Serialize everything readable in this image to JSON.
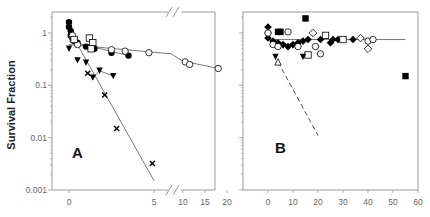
{
  "figure": {
    "ylabel": "Survival Fraction",
    "panels": [
      "A",
      "B"
    ]
  },
  "chart_data": [
    {
      "type": "scatter",
      "panel_label": "A",
      "title": "",
      "xlabel": "",
      "ylabel": "Survival Fraction",
      "yscale": "log",
      "ylim": [
        0.001,
        2
      ],
      "yticks": [
        "0.001",
        "0.01",
        "0.1",
        "1"
      ],
      "xticks": [
        "0",
        "5",
        "10",
        "15",
        "20"
      ],
      "x_axis_break": [
        6,
        9
      ],
      "grid": false,
      "series": [
        {
          "name": "filled circles",
          "marker": "filled-circle",
          "points": [
            [
              0,
              1.6
            ],
            [
              0,
              1.3
            ],
            [
              0.1,
              1.1
            ],
            [
              0.1,
              0.9
            ],
            [
              0.2,
              0.8
            ],
            [
              0.3,
              0.7
            ],
            [
              0.5,
              0.65
            ],
            [
              1,
              0.55
            ],
            [
              1.5,
              0.5
            ],
            [
              2.5,
              0.42
            ],
            [
              3.5,
              0.37
            ]
          ],
          "fit": [
            [
              0,
              0.7
            ],
            [
              3.5,
              0.37
            ]
          ]
        },
        {
          "name": "open circles",
          "marker": "open-circle",
          "points": [
            [
              0.2,
              0.9
            ],
            [
              0.5,
              0.6
            ],
            [
              1.3,
              0.55
            ],
            [
              2.5,
              0.48
            ],
            [
              3.3,
              0.45
            ],
            [
              4.7,
              0.42
            ],
            [
              10.5,
              0.28
            ],
            [
              11.5,
              0.25
            ],
            [
              18,
              0.21
            ]
          ],
          "fit": [
            [
              0,
              0.6
            ],
            [
              6,
              0.4
            ],
            [
              10,
              0.29
            ],
            [
              18,
              0.21
            ]
          ]
        },
        {
          "name": "open squares",
          "marker": "open-square",
          "points": [
            [
              0.3,
              0.75
            ],
            [
              1.2,
              0.8
            ],
            [
              1.4,
              0.65
            ],
            [
              1.3,
              0.5
            ]
          ]
        },
        {
          "name": "filled triangles down",
          "marker": "filled-triangle-down",
          "points": [
            [
              0,
              0.5
            ],
            [
              0.5,
              0.3
            ],
            [
              1,
              0.27
            ],
            [
              1.4,
              0.14
            ],
            [
              1.8,
              0.19
            ],
            [
              2.6,
              0.15
            ]
          ],
          "fit": [
            [
              1.4,
              0.14
            ],
            [
              1.8,
              0.19
            ],
            [
              2.6,
              0.15
            ]
          ]
        },
        {
          "name": "crosses",
          "marker": "x",
          "points": [
            [
              1.1,
              0.17
            ],
            [
              2.1,
              0.065
            ],
            [
              2.8,
              0.015
            ],
            [
              4.9,
              0.0032
            ]
          ],
          "fit": [
            [
              0.5,
              0.6
            ],
            [
              5,
              0.0015
            ]
          ]
        }
      ]
    },
    {
      "type": "scatter",
      "panel_label": "B",
      "title": "",
      "xlabel": "",
      "ylabel": "",
      "yscale": "log",
      "ylim": [
        0.001,
        2
      ],
      "xticks": [
        "0",
        "10",
        "20",
        "30",
        "40",
        "50",
        "60"
      ],
      "xlim": [
        -10,
        60
      ],
      "grid": false,
      "series": [
        {
          "name": "filled diamonds",
          "marker": "filled-diamond",
          "points": [
            [
              0,
              1.3
            ],
            [
              0,
              1.0
            ],
            [
              0,
              0.8
            ],
            [
              2,
              0.7
            ],
            [
              4,
              0.65
            ],
            [
              6,
              0.6
            ],
            [
              8,
              0.55
            ],
            [
              10,
              0.6
            ],
            [
              12,
              0.65
            ],
            [
              14,
              0.7
            ],
            [
              16,
              0.75
            ],
            [
              21,
              0.75
            ],
            [
              25,
              0.65
            ],
            [
              26,
              0.75
            ],
            [
              28,
              0.75
            ],
            [
              34,
              0.75
            ]
          ],
          "fit": [
            [
              0,
              0.75
            ],
            [
              55,
              0.75
            ]
          ]
        },
        {
          "name": "open diamonds",
          "marker": "open-diamond",
          "points": [
            [
              18,
              1.0
            ],
            [
              37,
              0.8
            ],
            [
              40,
              0.5
            ]
          ]
        },
        {
          "name": "open circles",
          "marker": "open-circle",
          "points": [
            [
              0,
              1.0
            ],
            [
              2,
              0.6
            ],
            [
              4,
              0.55
            ],
            [
              8,
              1.05
            ],
            [
              12,
              0.55
            ],
            [
              19,
              0.55
            ],
            [
              21,
              0.4
            ],
            [
              40,
              0.7
            ],
            [
              42,
              0.75
            ]
          ]
        },
        {
          "name": "filled squares",
          "marker": "filled-square",
          "points": [
            [
              4,
              1.05
            ],
            [
              5,
              1.05
            ],
            [
              15,
              1.9
            ],
            [
              55,
              0.15
            ]
          ]
        },
        {
          "name": "open squares",
          "marker": "open-square",
          "points": [
            [
              16,
              0.38
            ],
            [
              23,
              0.9
            ],
            [
              30,
              0.75
            ]
          ]
        },
        {
          "name": "filled triangles down",
          "marker": "filled-triangle-down",
          "points": [
            [
              3,
              0.35
            ],
            [
              14,
              0.35
            ]
          ]
        },
        {
          "name": "open triangle",
          "marker": "open-triangle",
          "points": [
            [
              4,
              0.28
            ]
          ],
          "fit_dashed": [
            [
              4,
              0.28
            ],
            [
              20,
              0.011
            ]
          ]
        }
      ]
    }
  ]
}
